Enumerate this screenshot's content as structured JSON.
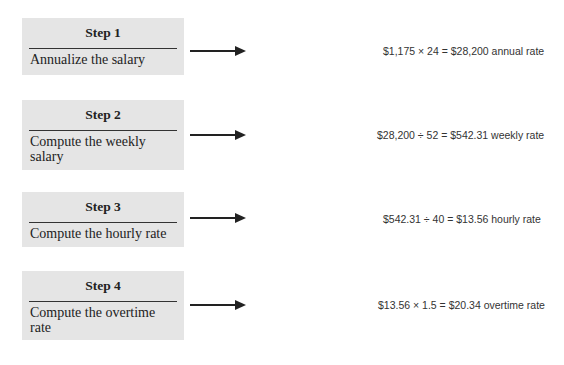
{
  "steps": [
    {
      "title": "Step 1",
      "description": "Annualize the salary",
      "equation": "$1,175 × 24 = $28,200 annual rate"
    },
    {
      "title": "Step 2",
      "description": "Compute the weekly salary",
      "equation": "$28,200 ÷ 52 = $542.31 weekly rate"
    },
    {
      "title": "Step 3",
      "description": "Compute the hourly rate",
      "equation": "$542.31 ÷ 40 = $13.56 hourly rate"
    },
    {
      "title": "Step 4",
      "description": "Compute the overtime rate",
      "equation": "$13.56 × 1.5 = $20.34 overtime rate"
    }
  ],
  "colors": {
    "box_fill": "#e5e5e5",
    "text": "#222222",
    "equation_text": "#333333"
  }
}
